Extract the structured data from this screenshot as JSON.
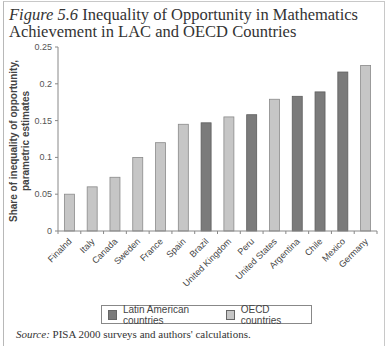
{
  "figure": {
    "number_label": "Figure 5.6",
    "title_line1": "Inequality of Opportunity in Mathematics",
    "title_line2": "Achievement in LAC and OECD Countries"
  },
  "colors": {
    "latin_american": "#7b7b7b",
    "oecd": "#c6c6c6",
    "axis": "#888888"
  },
  "legend": {
    "items": [
      {
        "label": "Latin American countries",
        "color": "#7b7b7b"
      },
      {
        "label": "OECD countries",
        "color": "#c6c6c6"
      }
    ]
  },
  "source": {
    "label": "Source:",
    "text": "PISA 2000 surveys and authors' calculations."
  },
  "chart_data": {
    "type": "bar",
    "title": "Inequality of Opportunity in Mathematics Achievement in LAC and OECD Countries",
    "xlabel": "",
    "ylabel": "Share of inequality of opportunity, parametric estimates",
    "ylim": [
      0,
      0.25
    ],
    "yticks": [
      "0",
      "0.05",
      "0.1",
      "0.15",
      "0.2",
      "0.25"
    ],
    "grid": false,
    "legend_position": "bottom",
    "categories": [
      "Finalnd",
      "Italy",
      "Canada",
      "Sweden",
      "France",
      "Spain",
      "Brazil",
      "United Kingdom",
      "Peru",
      "United States",
      "Argentina",
      "Chile",
      "Mexico",
      "Germany"
    ],
    "groups": [
      "OECD countries",
      "OECD countries",
      "OECD countries",
      "OECD countries",
      "OECD countries",
      "OECD countries",
      "Latin American countries",
      "OECD countries",
      "Latin American countries",
      "OECD countries",
      "Latin American countries",
      "Latin American countries",
      "Latin American countries",
      "OECD countries"
    ],
    "values": [
      0.05,
      0.06,
      0.073,
      0.1,
      0.12,
      0.145,
      0.147,
      0.155,
      0.158,
      0.179,
      0.183,
      0.189,
      0.216,
      0.225
    ],
    "series": [
      {
        "name": "Latin American countries",
        "values": [
          null,
          null,
          null,
          null,
          null,
          null,
          0.147,
          null,
          0.158,
          null,
          0.183,
          0.189,
          0.216,
          null
        ]
      },
      {
        "name": "OECD countries",
        "values": [
          0.05,
          0.06,
          0.073,
          0.1,
          0.12,
          0.145,
          null,
          0.155,
          null,
          0.179,
          null,
          null,
          null,
          0.225
        ]
      }
    ]
  }
}
